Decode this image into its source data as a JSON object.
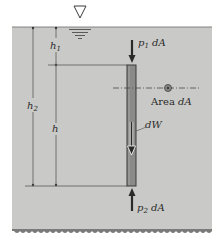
{
  "figure": {
    "colors": {
      "water": "#c9c9c7",
      "column": "#8a8a88",
      "column_edge": "#3a3a3a",
      "line": "#5a5a5a",
      "bottom_edge": "#7a7a7a"
    },
    "labels": {
      "h1": "h",
      "h1_sub": "1",
      "h2": "h",
      "h2_sub": "2",
      "h": "h",
      "p1_force_p": "p",
      "p1_force_sub": "1",
      "p1_force_rest": " dA",
      "p2_force_p": "p",
      "p2_force_sub": "2",
      "p2_force_rest": " dA",
      "area_word": "Area ",
      "area_var": "dA",
      "weight": "dW"
    },
    "icons": {
      "free_surface": "inverted-triangle-free-surface-icon",
      "area": "circle-area-element-icon"
    }
  }
}
